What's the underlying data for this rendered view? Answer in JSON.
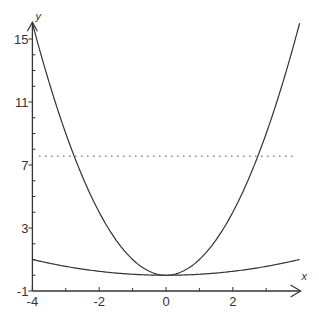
{
  "chart_data": {
    "type": "line",
    "title": "",
    "xlabel": "x",
    "ylabel": "y",
    "xlim": [
      -4,
      4
    ],
    "ylim": [
      -1,
      16
    ],
    "grid": false,
    "legend": null,
    "x_ticks": [
      -4,
      -2,
      0,
      2
    ],
    "x_tick_labels": [
      "-4",
      "-2",
      "0",
      "2"
    ],
    "x_minor_ticks": [
      -3,
      -1,
      1,
      3
    ],
    "y_ticks": [
      -1,
      3,
      7,
      11,
      15
    ],
    "y_tick_labels": [
      "-1",
      "3",
      "7",
      "11",
      "15"
    ],
    "y_minor_ticks": [
      0,
      1,
      2,
      4,
      5,
      6,
      8,
      9,
      10,
      12,
      13,
      14
    ],
    "series": [
      {
        "name": "y = x^2",
        "style": "solid",
        "color": "#333333",
        "x": [
          -4,
          -3,
          -2,
          -1,
          0,
          1,
          2,
          3,
          4
        ],
        "values": [
          16,
          9,
          4,
          1,
          0,
          1,
          4,
          9,
          16
        ]
      },
      {
        "name": "y = x^2/16",
        "style": "solid",
        "color": "#333333",
        "x": [
          -4,
          -3,
          -2,
          -1,
          0,
          1,
          2,
          3,
          4
        ],
        "values": [
          1,
          0.5625,
          0.25,
          0.0625,
          0,
          0.0625,
          0.25,
          0.5625,
          1
        ]
      },
      {
        "name": "horizontal line",
        "style": "dotted",
        "color": "#888888",
        "x": [
          -3.8,
          3.8
        ],
        "values": [
          7.56,
          7.56
        ]
      }
    ]
  }
}
